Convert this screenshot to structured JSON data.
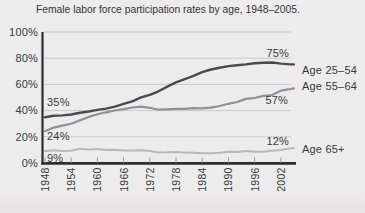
{
  "chart_data": {
    "type": "line",
    "title": "Female labor force participation rates by age, 1948–2005.",
    "xlabel": "",
    "ylabel": "",
    "xlim": [
      1948,
      2005
    ],
    "ylim": [
      0,
      100
    ],
    "grid": "horizontal",
    "legend_position": "right-of-line-ends",
    "x_ticks": [
      1948,
      1954,
      1960,
      1966,
      1972,
      1978,
      1984,
      1990,
      1996,
      2002
    ],
    "y_tick_labels": [
      "0%",
      "20%",
      "40%",
      "60%",
      "80%",
      "100%"
    ],
    "x": [
      1948,
      1950,
      1952,
      1954,
      1956,
      1958,
      1960,
      1962,
      1964,
      1966,
      1968,
      1970,
      1972,
      1974,
      1976,
      1978,
      1980,
      1982,
      1984,
      1986,
      1988,
      1990,
      1992,
      1994,
      1996,
      1998,
      2000,
      2002,
      2004,
      2005
    ],
    "series": [
      {
        "name": "Age 25–54",
        "start_label": "35%",
        "end_label": "75%",
        "color": "#4b4b4d",
        "values": [
          35,
          36,
          36.3,
          37,
          38.3,
          39.3,
          40.5,
          41.5,
          43,
          45.1,
          47.1,
          50.1,
          52,
          54.7,
          58.3,
          61.6,
          64,
          66.5,
          69.4,
          71.4,
          72.7,
          74,
          74.6,
          75.3,
          76.1,
          76.5,
          76.7,
          75.9,
          75.3,
          75.3
        ]
      },
      {
        "name": "Age 55–64",
        "start_label": "24%",
        "end_label": "57%",
        "color": "#909194",
        "values": [
          24.3,
          27,
          28.5,
          30,
          32.5,
          35.2,
          37.2,
          38.7,
          40.1,
          41.1,
          42.4,
          43,
          42.1,
          40.7,
          41,
          41.4,
          41.3,
          41.8,
          41.7,
          42.3,
          43.5,
          45.2,
          46.6,
          48.9,
          49.6,
          51.2,
          51.9,
          55.2,
          56.3,
          57
        ]
      },
      {
        "name": "Age 65+",
        "start_label": "9%",
        "end_label": "12%",
        "color": "#b7b8ba",
        "values": [
          9.1,
          9.7,
          9.1,
          9.3,
          10.9,
          10.3,
          10.8,
          10,
          10.1,
          9.6,
          9.6,
          9.7,
          9.1,
          8.1,
          8.2,
          8.4,
          8.1,
          7.9,
          7.5,
          7.4,
          7.9,
          8.6,
          8.3,
          9.2,
          8.6,
          8.6,
          9.4,
          9.9,
          11.1,
          11.5
        ]
      }
    ],
    "colors": {
      "axis": "#2d2c2e",
      "gridline": "#cbcacc",
      "tick": "#9b9a9c",
      "text": "#3a393b",
      "background": "#edecec"
    }
  }
}
